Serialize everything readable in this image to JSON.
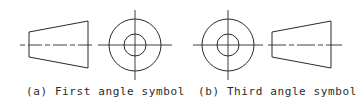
{
  "figures": [
    {
      "id": "a",
      "caption": "(a) First angle symbol",
      "layout": "truncated-cone view left, circles view right"
    },
    {
      "id": "b",
      "caption": "(b) Third angle symbol",
      "layout": "circles view left, truncated-cone view right"
    }
  ],
  "colors": {
    "line": "#2a2a2a",
    "background": "#ffffff"
  }
}
